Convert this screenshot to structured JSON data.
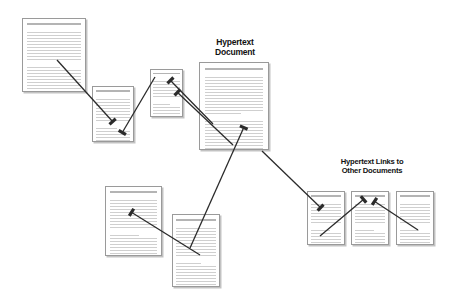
{
  "diagram": {
    "background_color": "#ffffff",
    "line_color": "#2b2b2b",
    "page_border_color": "#9a9a9a",
    "text_line_color": "#cfcfcf"
  },
  "labels": {
    "main_document": "Hypertext\nDocument",
    "links": "Hypertext Links to\nOther Documents"
  },
  "pages": [
    {
      "id": "page-top-left",
      "name": "document-page-top-left",
      "x": 22,
      "y": 18,
      "w": 64,
      "h": 74,
      "lines": 26
    },
    {
      "id": "page-upper-mid-left",
      "name": "document-page-upper-mid-left",
      "x": 92,
      "y": 86,
      "w": 42,
      "h": 56,
      "lines": 20
    },
    {
      "id": "page-small-center",
      "name": "document-page-small-center",
      "x": 150,
      "y": 69,
      "w": 33,
      "h": 48,
      "lines": 17
    },
    {
      "id": "page-main",
      "name": "hypertext-document-main-page",
      "x": 199,
      "y": 62,
      "w": 70,
      "h": 88,
      "lines": 31
    },
    {
      "id": "page-lower-left",
      "name": "document-page-lower-left",
      "x": 105,
      "y": 186,
      "w": 57,
      "h": 70,
      "lines": 25
    },
    {
      "id": "page-lower-mid",
      "name": "document-page-lower-mid",
      "x": 172,
      "y": 214,
      "w": 48,
      "h": 73,
      "lines": 26
    },
    {
      "id": "page-link-1",
      "name": "linked-document-page-1",
      "x": 307,
      "y": 191,
      "w": 38,
      "h": 54,
      "lines": 19
    },
    {
      "id": "page-link-2",
      "name": "linked-document-page-2",
      "x": 351,
      "y": 191,
      "w": 38,
      "h": 54,
      "lines": 19
    },
    {
      "id": "page-link-3",
      "name": "linked-document-page-3",
      "x": 396,
      "y": 191,
      "w": 38,
      "h": 54,
      "lines": 19
    }
  ],
  "label_positions": {
    "main_document": {
      "x": 206,
      "y": 38,
      "w": 58
    },
    "links": {
      "x": 330,
      "y": 158,
      "w": 84
    }
  },
  "arrows": [
    {
      "name": "arrow-top-left-to-upper-mid-left",
      "x1": 57,
      "y1": 60,
      "x2": 113,
      "y2": 122,
      "head_angle": 0
    },
    {
      "name": "arrow-small-center-to-upper-mid-left",
      "x1": 155,
      "y1": 77,
      "x2": 122,
      "y2": 133,
      "head_angle": 0
    },
    {
      "name": "arrow-main-to-small-center",
      "x1": 213,
      "y1": 124,
      "x2": 170,
      "y2": 80,
      "head_angle": 0
    },
    {
      "name": "arrow-main-to-small-center-lower",
      "x1": 233,
      "y1": 145,
      "x2": 177,
      "y2": 92,
      "head_angle": 0
    },
    {
      "name": "arrow-lower-mid-to-main",
      "x1": 190,
      "y1": 248,
      "x2": 244,
      "y2": 127,
      "head_angle": 0
    },
    {
      "name": "arrow-lower-mid-to-lower-left",
      "x1": 200,
      "y1": 255,
      "x2": 131,
      "y2": 212,
      "head_angle": 0
    },
    {
      "name": "arrow-main-to-link-1",
      "x1": 262,
      "y1": 151,
      "x2": 321,
      "y2": 208,
      "head_angle": 0
    },
    {
      "name": "arrow-link-1-to-link-2",
      "x1": 320,
      "y1": 236,
      "x2": 364,
      "y2": 199,
      "head_angle": 0
    },
    {
      "name": "arrow-link-3-to-link-2",
      "x1": 418,
      "y1": 230,
      "x2": 374,
      "y2": 201,
      "head_angle": 0
    }
  ]
}
